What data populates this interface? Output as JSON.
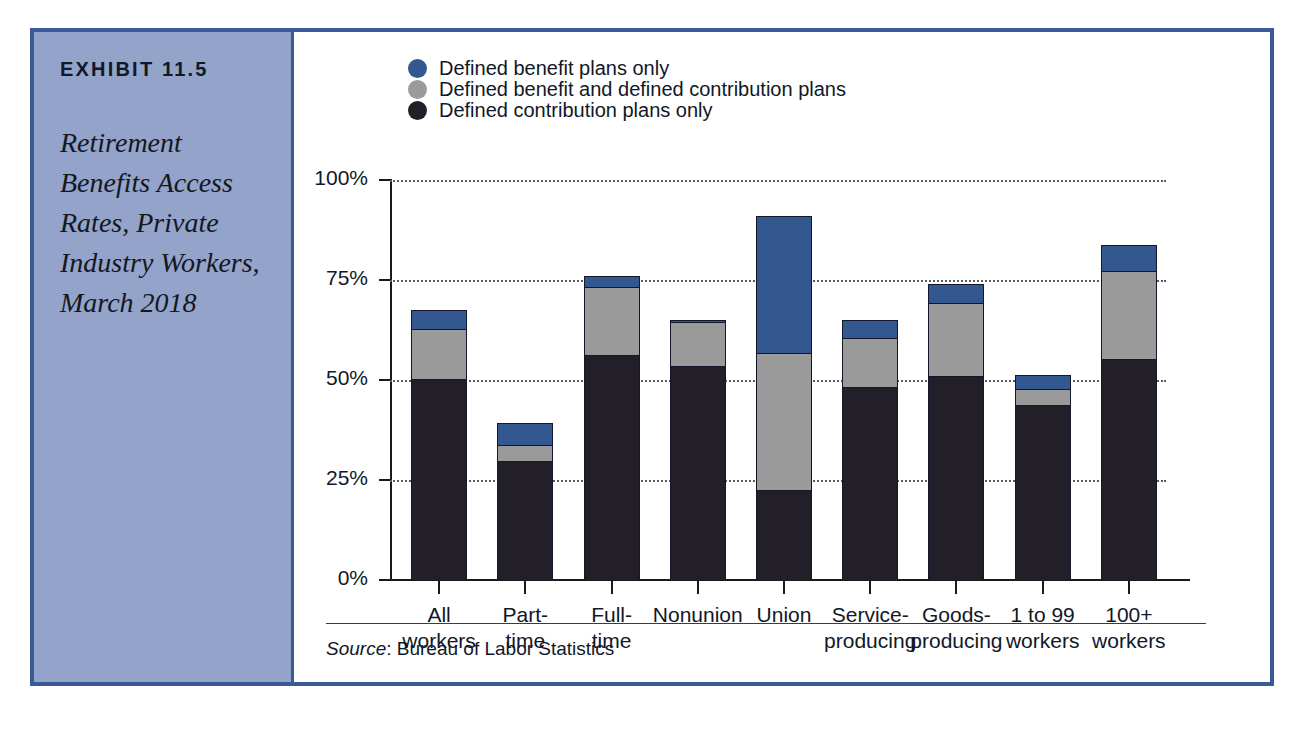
{
  "exhibit": {
    "number": "EXHIBIT 11.5",
    "title": "Retirement Benefits Access Rates, Private Industry Workers, March 2018"
  },
  "source": {
    "label": "Source",
    "separator": ": ",
    "text": "Bureau of Labor Statistics"
  },
  "colors": {
    "frame_border": "#3a5a96",
    "sidebar_fill": "#93a3c9",
    "defined_benefit_only": "#33588f",
    "defined_benefit_and_contribution": "#9a9a9a",
    "defined_contribution_only": "#231f28"
  },
  "legend": {
    "position": "top-left",
    "items": [
      {
        "label": "Defined benefit plans only",
        "color": "#33588f",
        "key": "defined_benefit_only"
      },
      {
        "label": "Defined benefit and defined contribution plans",
        "color": "#9a9a9a",
        "key": "defined_benefit_and_contribution"
      },
      {
        "label": "Defined contribution plans only",
        "color": "#231f28",
        "key": "defined_contribution_only"
      }
    ]
  },
  "chart_data": {
    "type": "bar",
    "stacked": true,
    "title": "Retirement Benefits Access Rates, Private Industry Workers, March 2018",
    "xlabel": "",
    "ylabel": "",
    "ylim": [
      0,
      100
    ],
    "yticks": [
      0,
      25,
      50,
      75,
      100
    ],
    "ytick_labels": [
      "0%",
      "25%",
      "50%",
      "75%",
      "100%"
    ],
    "grid": "horizontal-dotted",
    "legend_position": "top-left",
    "units": "percent",
    "categories": [
      "All workers",
      "Part-time",
      "Full-time",
      "Nonunion",
      "Union",
      "Service-producing",
      "Goods-producing",
      "1 to 99 workers",
      "100+ workers"
    ],
    "category_lines": [
      [
        "All",
        "workers"
      ],
      [
        "Part-",
        "time"
      ],
      [
        "Full-",
        "time"
      ],
      [
        "Nonunion",
        ""
      ],
      [
        "Union",
        ""
      ],
      [
        "Service-",
        "producing"
      ],
      [
        "Goods-",
        "producing"
      ],
      [
        "1 to 99",
        "workers"
      ],
      [
        "100+",
        "workers"
      ]
    ],
    "series": [
      {
        "name": "Defined contribution plans only",
        "color": "#231f28",
        "values": [
          50.5,
          30.0,
          56.5,
          53.8,
          22.5,
          48.5,
          51.3,
          44.0,
          55.3
        ]
      },
      {
        "name": "Defined benefit and defined contribution plans",
        "color": "#9a9a9a",
        "values": [
          12.5,
          4.0,
          17.0,
          11.0,
          34.3,
          12.3,
          18.2,
          4.0,
          22.2
        ]
      },
      {
        "name": "Defined benefit plans only",
        "color": "#33588f",
        "values": [
          4.5,
          5.3,
          2.5,
          0.2,
          34.2,
          4.2,
          4.5,
          3.3,
          6.3
        ]
      }
    ],
    "totals": [
      67.5,
      39.3,
      76.0,
      65.0,
      91.0,
      65.0,
      74.0,
      51.3,
      83.8
    ]
  }
}
